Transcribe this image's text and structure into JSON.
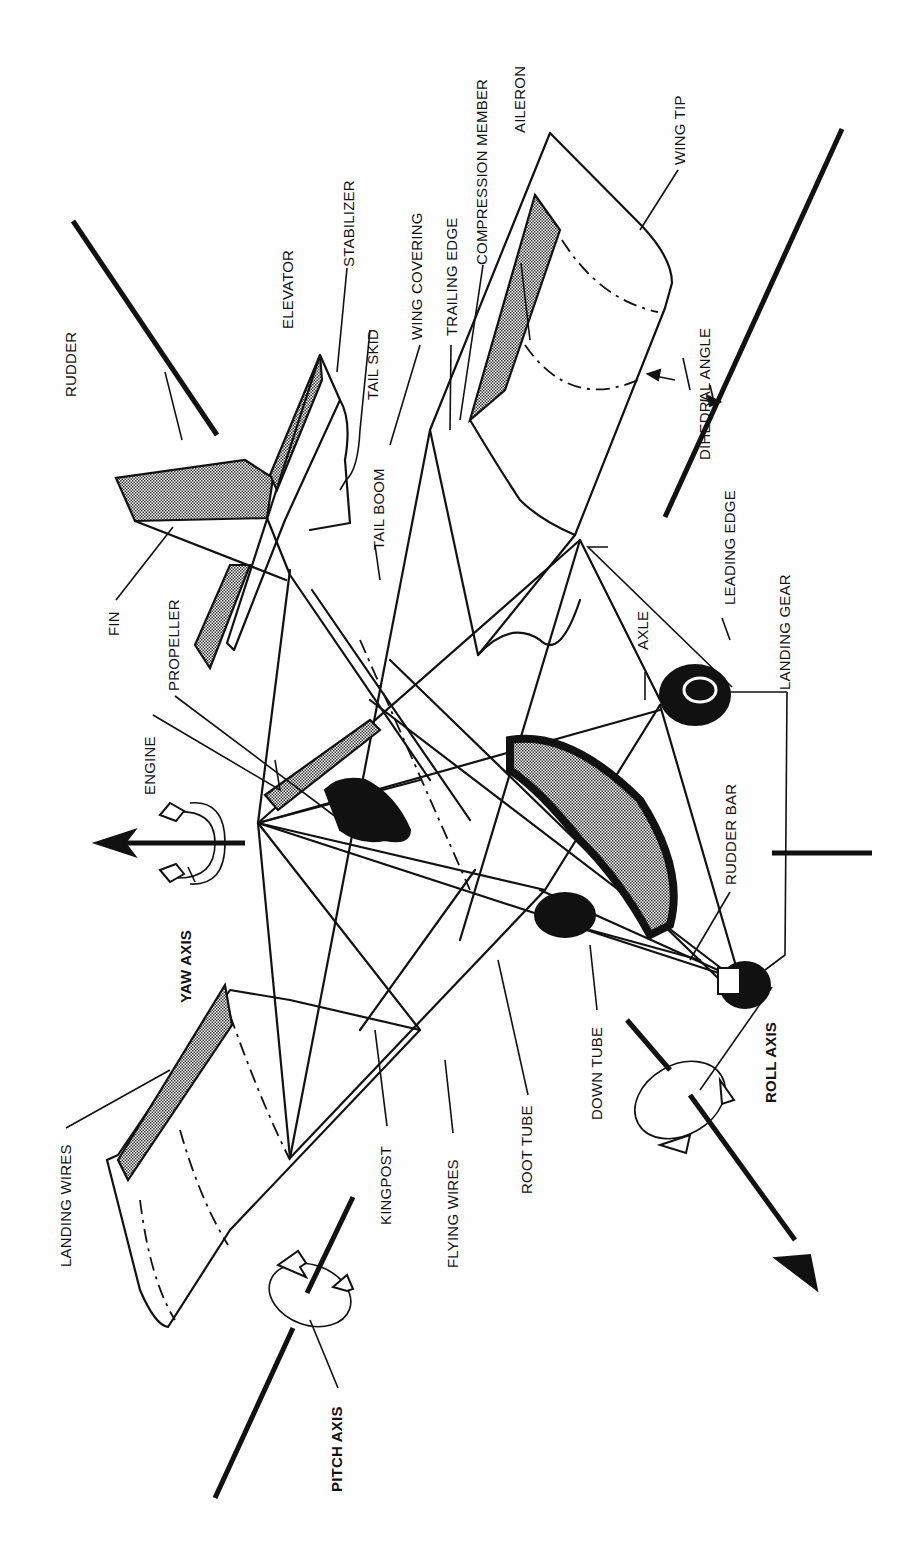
{
  "diagram": {
    "orientation": "rotated 90 degrees counter-clockwise",
    "labels": {
      "rudder": "RUDDER",
      "elevator": "ELEVATOR",
      "stabilizer": "STABILIZER",
      "tail_skid": "TAIL SKID",
      "wing_covering": "WING COVERING",
      "trailing_edge": "TRAILING EDGE",
      "compression_member": "COMPRESSION MEMBER",
      "aileron": "AILERON",
      "wing_tip": "WING TIP",
      "dihedral_angle": "DIHEDRAL ANGLE",
      "fin": "FIN",
      "propeller": "PROPELLER",
      "tail_boom": "TAIL BOOM",
      "engine": "ENGINE",
      "leading_edge": "LEADING EDGE",
      "landing_gear": "LANDING GEAR",
      "axle": "AXLE",
      "yaw_axis": "YAW AXIS",
      "rudder_bar": "RUDDER BAR",
      "landing_wires": "LANDING WIRES",
      "kingpost": "KINGPOST",
      "flying_wires": "FLYING WIRES",
      "root_tube": "ROOT TUBE",
      "down_tube": "DOWN TUBE",
      "roll_axis": "ROLL AXIS",
      "pitch_axis": "PITCH AXIS"
    }
  }
}
